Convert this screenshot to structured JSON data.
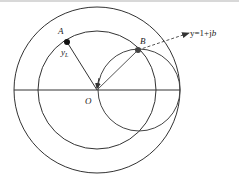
{
  "diagram": {
    "type": "admittance-circle-diagram",
    "labels": {
      "point_a": "A",
      "point_a_value": "y",
      "point_a_sub": "L",
      "point_b": "B",
      "origin": "O",
      "target_prefix": "y=1+j",
      "target_b": "b"
    },
    "colors": {
      "stroke": "#333333",
      "dashed": "#555555",
      "point": "#111111",
      "point_b": "#444444"
    },
    "geometry": {
      "center": [
        97,
        90
      ],
      "outer_circle_radius": 83,
      "middle_circle_radius": 59,
      "unit_g_circle_center": [
        139,
        90
      ],
      "unit_g_circle_radius": 41,
      "point_a": [
        67,
        42
      ],
      "point_b": [
        138,
        50
      ],
      "horizontal_axis": [
        [
          14,
          90
        ],
        [
          180,
          90
        ]
      ],
      "dashed_arrow_end": [
        189,
        33
      ]
    }
  }
}
